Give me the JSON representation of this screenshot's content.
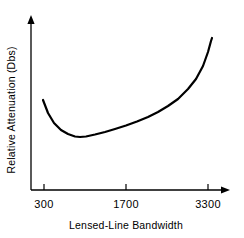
{
  "chart_data": {
    "type": "line",
    "title": "",
    "subtitle": "",
    "xlabel": "Lensed-Line Bandwidth",
    "ylabel": "Relative Attenuation (Dbs)",
    "xticks": [
      "300",
      "1700",
      "3300"
    ],
    "xtick_values": [
      300,
      1700,
      3300
    ],
    "yticks": [],
    "xlim": [
      300,
      3300
    ],
    "ylim": [
      0,
      1
    ],
    "grid": false,
    "legend": false,
    "legend_position": "none",
    "annotations": [],
    "series": [
      {
        "name": "Relative Attenuation",
        "description": "Convex U-shaped curve: high at low bandwidth, minimum near 1000, rising steeply toward 3300",
        "x": [
          300,
          500,
          700,
          900,
          1000,
          1100,
          1300,
          1500,
          1700,
          1900,
          2100,
          2300,
          2500,
          2700,
          2900,
          3100,
          3250,
          3300
        ],
        "values": [
          0.62,
          0.4,
          0.31,
          0.285,
          0.283,
          0.29,
          0.31,
          0.34,
          0.38,
          0.42,
          0.47,
          0.52,
          0.58,
          0.65,
          0.73,
          0.83,
          0.94,
          1.0
        ]
      }
    ],
    "curve_pixel_points": [
      [
        43,
        100
      ],
      [
        48,
        113
      ],
      [
        54,
        123
      ],
      [
        61,
        130
      ],
      [
        68,
        134
      ],
      [
        75,
        136.5
      ],
      [
        80,
        137
      ],
      [
        86,
        136.5
      ],
      [
        95,
        134.5
      ],
      [
        105,
        132
      ],
      [
        115,
        129
      ],
      [
        126,
        125.5
      ],
      [
        137,
        121.5
      ],
      [
        148,
        117
      ],
      [
        158,
        112
      ],
      [
        168,
        106
      ],
      [
        178,
        99
      ],
      [
        188,
        89
      ],
      [
        196,
        79
      ],
      [
        203,
        66
      ],
      [
        208,
        52
      ],
      [
        211,
        41
      ],
      [
        212,
        38
      ]
    ],
    "style": {
      "background": "#ffffff",
      "line_color": "#000000",
      "axis_color": "#000000",
      "text_color": "#000000",
      "line_width": 2.2,
      "axis_width": 1.3
    },
    "axes_geometry": {
      "origin_x": 31,
      "baseline_y": 190,
      "y_axis_top": 16,
      "x_axis_right": 230,
      "tick_x_positions": [
        44,
        126,
        208
      ],
      "tick_length": 5
    }
  }
}
